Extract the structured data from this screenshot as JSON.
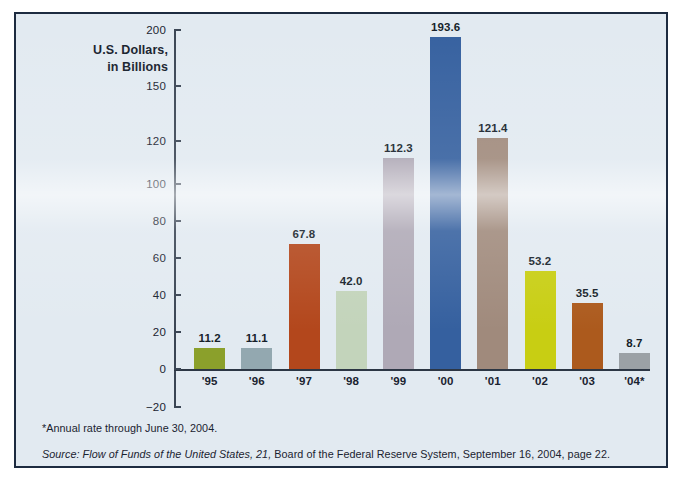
{
  "figure": {
    "frame_border_color": "#1d2b40",
    "background_color": "#e2eaf1",
    "page_color": "#ffffff"
  },
  "chart_data": {
    "type": "bar",
    "title": "U.S. Dollars,\nin Billions",
    "xlabel": "",
    "ylabel": "U.S. Dollars, in Billions",
    "categories": [
      "'95",
      "'96",
      "'97",
      "'98",
      "'99",
      "'00",
      "'01",
      "'02",
      "'03",
      "'04*"
    ],
    "values": [
      11.2,
      11.1,
      67.8,
      42.0,
      112.3,
      193.6,
      121.4,
      53.2,
      35.5,
      8.7
    ],
    "value_labels": [
      "11.2",
      "11.1",
      "67.8",
      "42.0",
      "112.3",
      "193.6",
      "121.4",
      "53.2",
      "35.5",
      "8.7"
    ],
    "bar_colors": [
      "#8ba02b",
      "#93a8b0",
      "#b3471c",
      "#c3d4bb",
      "#afa9b6",
      "#35609f",
      "#a08a7c",
      "#c8ce13",
      "#ac5a1d",
      "#9ba1a6"
    ],
    "ylim": [
      -20,
      200
    ],
    "yticks": [
      -20,
      0,
      20,
      40,
      60,
      80,
      100,
      120,
      150,
      200
    ],
    "ytick_labels": [
      "−20",
      "0",
      "20",
      "40",
      "60",
      "80",
      "100",
      "120",
      "150",
      "200"
    ],
    "axis_note": "y-axis is compressed above 120",
    "grid": false,
    "legend": "none"
  },
  "notes": {
    "footnote": "*Annual rate through June 30, 2004.",
    "source_italic": "Source: Flow of Funds of the United States, 21,",
    "source_rest": " Board of the Federal Reserve System, September 16, 2004, page 22."
  }
}
